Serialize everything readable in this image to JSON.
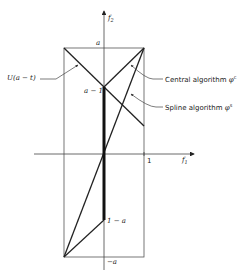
{
  "diagram": {
    "axes": {
      "x_label": "f",
      "x_label_sub": "1",
      "y_label": "f",
      "y_label_sub": "2",
      "x_tick_label": "1"
    },
    "point_labels": {
      "top": "a",
      "a_minus_1": "a − 1",
      "one_minus_a": "1 − a",
      "bottom": "−a"
    },
    "annotations": {
      "u_label": "U(a − t)",
      "central": "Central algorithm",
      "central_symbol": "φ",
      "central_sup": "c",
      "spline": "Spline algorithm",
      "spline_symbol": "φ",
      "spline_sup": "s"
    },
    "colors": {
      "line": "#222222",
      "thin_line": "#555555",
      "background": "#ffffff"
    }
  }
}
